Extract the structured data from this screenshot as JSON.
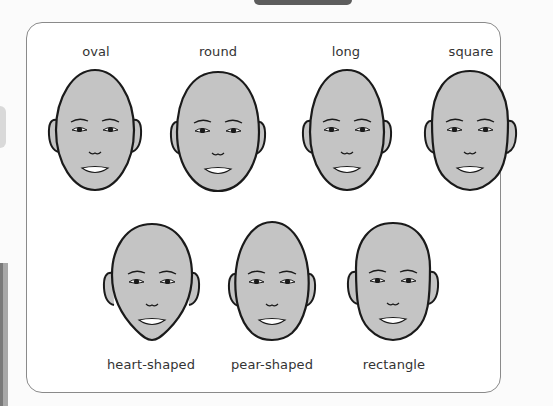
{
  "diagram": {
    "colors": {
      "skin": "#c4c4c4",
      "outline": "#1a1a1a",
      "frame_border": "#8a8a8a",
      "text": "#333333"
    },
    "rows": [
      {
        "faces": [
          {
            "label": "oval",
            "shape": "oval"
          },
          {
            "label": "round",
            "shape": "round"
          },
          {
            "label": "long",
            "shape": "long"
          },
          {
            "label": "square",
            "shape": "square"
          }
        ]
      },
      {
        "faces": [
          {
            "label": "heart-shaped",
            "shape": "heart-shaped"
          },
          {
            "label": "pear-shaped",
            "shape": "pear-shaped"
          },
          {
            "label": "rectangle",
            "shape": "rectangle"
          }
        ]
      }
    ]
  }
}
